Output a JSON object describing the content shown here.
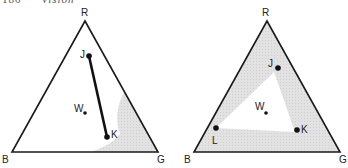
{
  "header": {
    "page_number": "180",
    "title": "Vision"
  },
  "colors": {
    "stroke": "#1a1a1a",
    "gamut_fill": "#e0e0e0",
    "background": "#ffffff"
  },
  "diagrams": [
    {
      "name": "two-primary-mixture",
      "vertices": {
        "R": "R",
        "G": "G",
        "B": "B"
      },
      "points": {
        "J": "J",
        "K": "K",
        "W": "W"
      },
      "description": "Line segment JK inside RGB color triangle; shaded crescent near G lies outside the JK mixture range"
    },
    {
      "name": "three-primary-mixture",
      "vertices": {
        "R": "R",
        "G": "G",
        "B": "B"
      },
      "points": {
        "J": "J",
        "K": "K",
        "L": "L",
        "W": "W"
      },
      "description": "Triangle JKL inside RGB color triangle; shaded region outside JKL gamut"
    }
  ]
}
